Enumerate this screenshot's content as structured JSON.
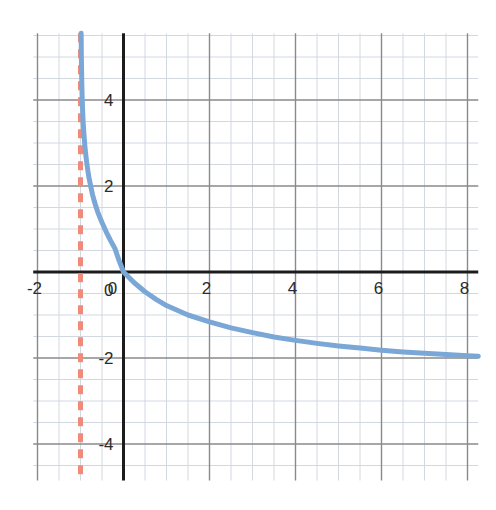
{
  "chart_data": {
    "type": "line",
    "title": "",
    "subtitle": "",
    "xlabel": "",
    "ylabel": "",
    "xlim": [
      -2.1,
      8.25
    ],
    "ylim": [
      -4.85,
      5.55
    ],
    "grid": true,
    "grid_major_step": 2,
    "grid_minor_step": 0.5,
    "legend": "none",
    "x_ticks": [
      -2,
      0,
      2,
      4,
      6,
      8
    ],
    "x_tick_labels": [
      "-2",
      "0",
      "2",
      "4",
      "6",
      "8"
    ],
    "y_ticks": [
      4,
      2,
      0,
      -2,
      -4
    ],
    "y_tick_labels": [
      "4",
      "2",
      "0",
      "-2",
      "-4"
    ],
    "axis_color": "#1c1c1c",
    "grid_major_color": "#8a8a8a",
    "grid_minor_color": "#d3d8e0",
    "background": "#ffffff",
    "series": [
      {
        "name": "curve",
        "type": "line",
        "color": "#7ba7d7",
        "width": 5,
        "style": "solid",
        "description": "decreasing logarithmic curve with vertical asymptote at x = -1, passing through the origin",
        "points": [
          [
            -0.985,
            5.55
          ],
          [
            -0.98,
            5.0
          ],
          [
            -0.97,
            4.4
          ],
          [
            -0.96,
            4.0
          ],
          [
            -0.95,
            3.75
          ],
          [
            -0.94,
            3.5
          ],
          [
            -0.92,
            3.2
          ],
          [
            -0.9,
            2.95
          ],
          [
            -0.88,
            2.75
          ],
          [
            -0.86,
            2.58
          ],
          [
            -0.84,
            2.43
          ],
          [
            -0.82,
            2.3
          ],
          [
            -0.8,
            2.18
          ],
          [
            -0.76,
            1.98
          ],
          [
            -0.72,
            1.8
          ],
          [
            -0.68,
            1.65
          ],
          [
            -0.64,
            1.52
          ],
          [
            -0.6,
            1.4
          ],
          [
            -0.55,
            1.27
          ],
          [
            -0.5,
            1.15
          ],
          [
            -0.45,
            1.04
          ],
          [
            -0.4,
            0.93
          ],
          [
            -0.35,
            0.83
          ],
          [
            -0.3,
            0.73
          ],
          [
            -0.25,
            0.64
          ],
          [
            -0.2,
            0.55
          ],
          [
            -0.15,
            0.4
          ],
          [
            -0.1,
            0.26
          ],
          [
            -0.05,
            0.13
          ],
          [
            0,
            0
          ],
          [
            0.25,
            -0.25
          ],
          [
            0.5,
            -0.46
          ],
          [
            0.75,
            -0.63
          ],
          [
            1.0,
            -0.78
          ],
          [
            1.5,
            -1.0
          ],
          [
            2.0,
            -1.16
          ],
          [
            2.5,
            -1.3
          ],
          [
            3.0,
            -1.41
          ],
          [
            3.5,
            -1.51
          ],
          [
            4.0,
            -1.59
          ],
          [
            4.5,
            -1.66
          ],
          [
            5.0,
            -1.72
          ],
          [
            5.5,
            -1.77
          ],
          [
            6.0,
            -1.82
          ],
          [
            6.5,
            -1.86
          ],
          [
            7.0,
            -1.89
          ],
          [
            7.5,
            -1.92
          ],
          [
            8.0,
            -1.95
          ],
          [
            8.25,
            -1.96
          ]
        ]
      },
      {
        "name": "vertical-asymptote",
        "type": "vline",
        "color": "#f08a7a",
        "width": 5,
        "style": "dashed",
        "dash_pattern": "9,7",
        "x": -1,
        "description": "vertical dashed asymptote at x = -1"
      }
    ]
  }
}
